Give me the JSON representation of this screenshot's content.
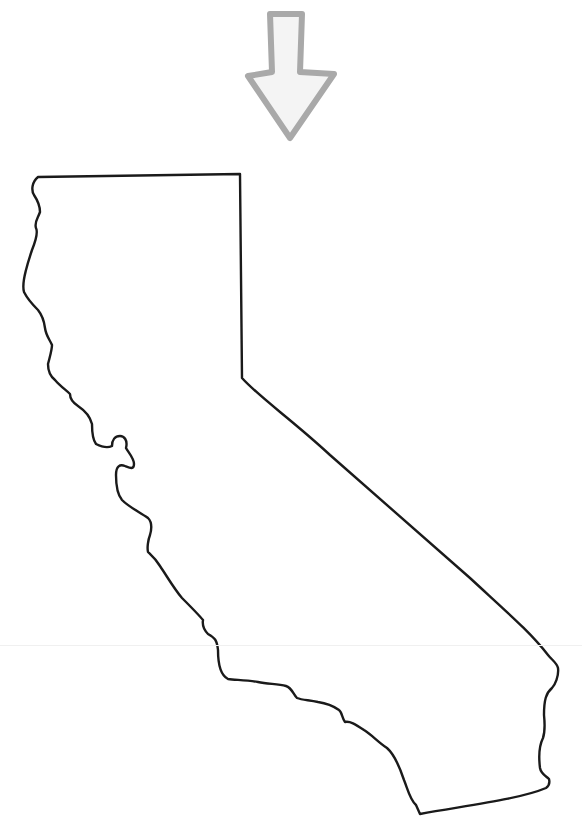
{
  "map": {
    "title": "California",
    "region": "California state outline",
    "outline_color": "#1a1a1a",
    "fill_color": "#ffffff"
  },
  "indicator": {
    "icon": "down-arrow-icon",
    "fill_color": "#f4f4f4",
    "stroke_color": "#a9a9a9"
  }
}
